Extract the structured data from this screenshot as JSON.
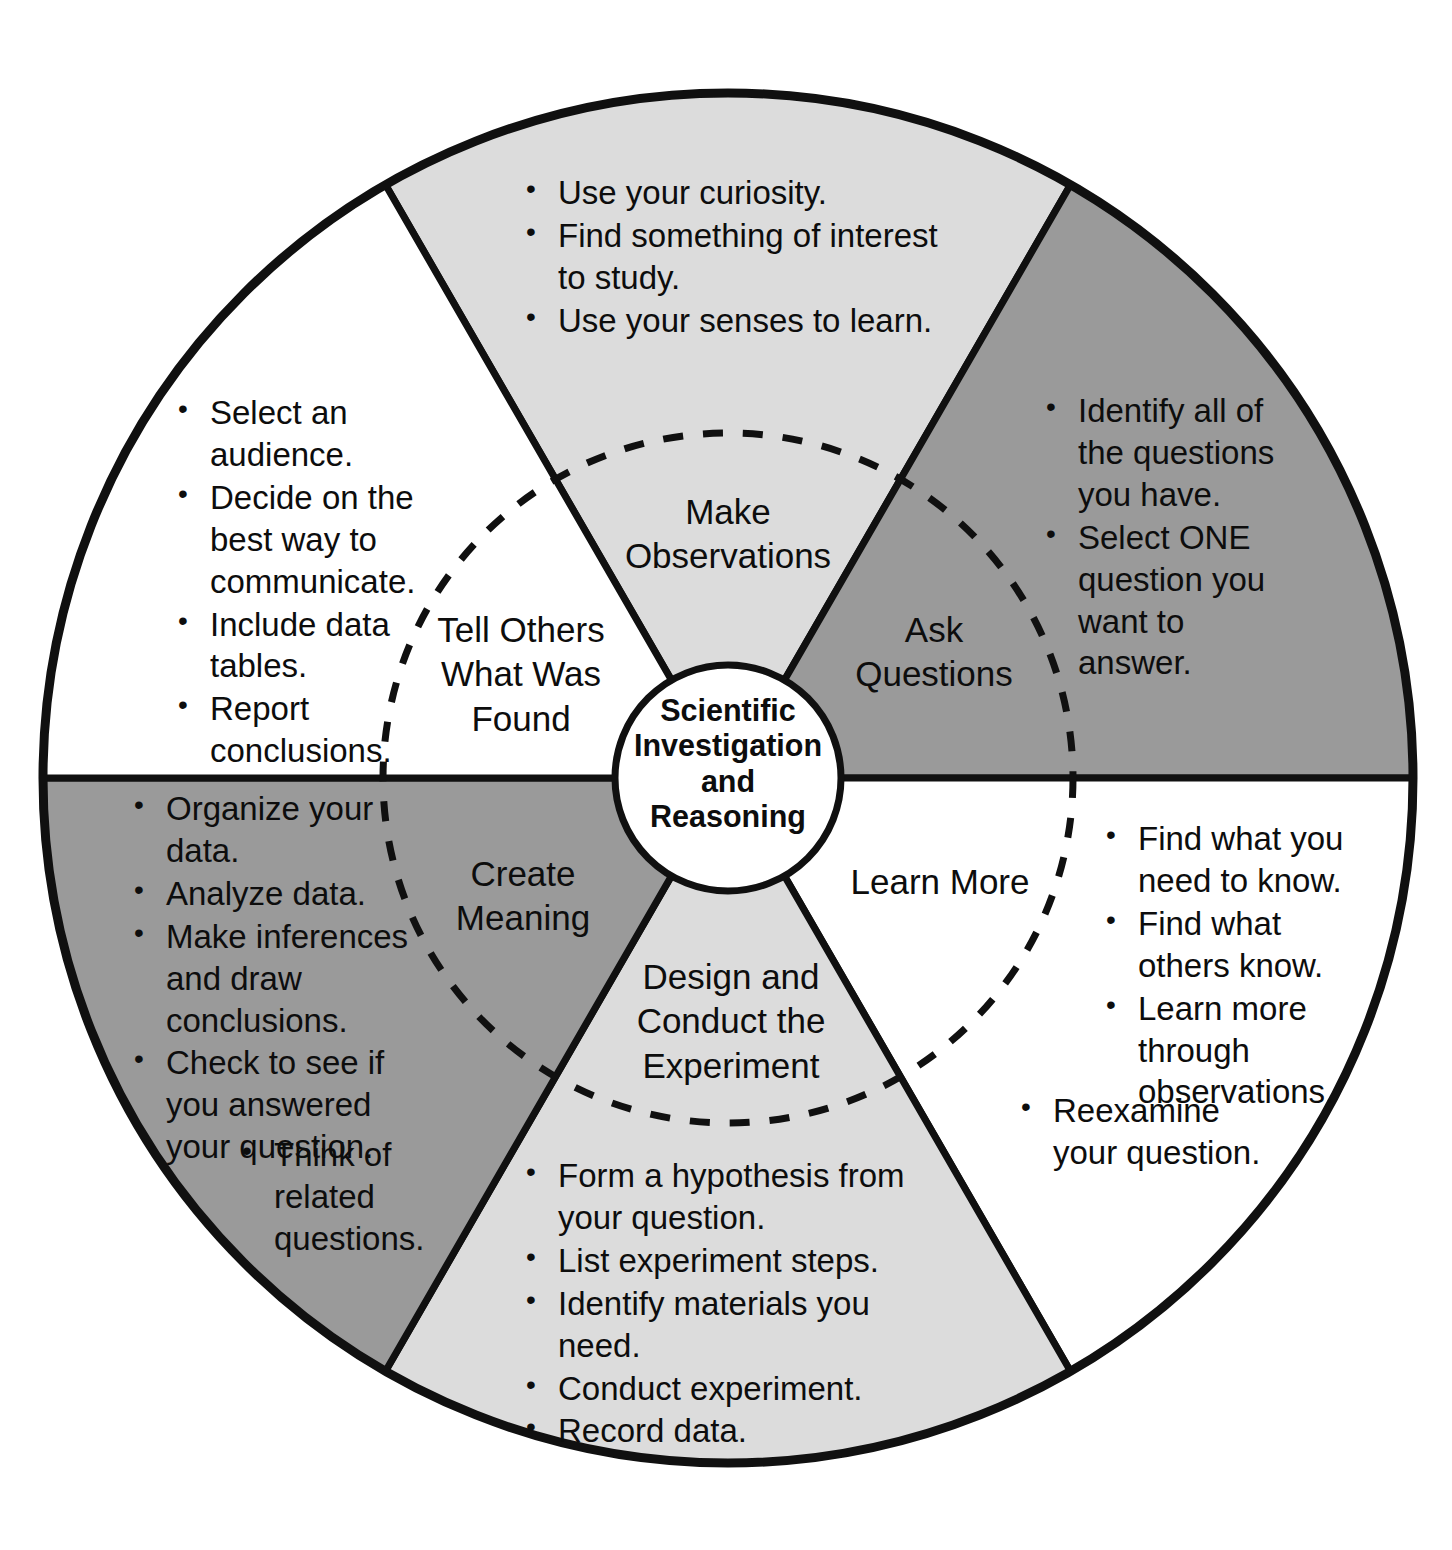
{
  "diagram": {
    "title": "Scientific Investigation and Reasoning",
    "type": "cycle-wheel",
    "hub_label": "Scientific\nInvestigation\nand\nReasoning",
    "colors": {
      "background": "#ffffff",
      "outline": "#101010",
      "light_gray": "#dcdcdc",
      "mid_gray": "#9a9a9a",
      "white_fill": "#ffffff"
    },
    "segments": [
      {
        "id": "make-observations",
        "label": "Make\nObservations",
        "fill": "#dcdcdc",
        "bullets": [
          "Use your curiosity.",
          "Find something of interest to study.",
          "Use your senses to learn."
        ]
      },
      {
        "id": "ask-questions",
        "label": "Ask\nQuestions",
        "fill": "#9a9a9a",
        "bullets": [
          "Identify all of the questions you have.",
          "Select ONE question you want to answer."
        ]
      },
      {
        "id": "learn-more",
        "label": "Learn More",
        "fill": "#ffffff",
        "bullets": [
          "Find what you need to know.",
          "Find what others know.",
          "Learn more through observations.",
          "Reexamine your question."
        ]
      },
      {
        "id": "design-and-conduct-the-experiment",
        "label": "Design and\nConduct the\nExperiment",
        "fill": "#dcdcdc",
        "bullets": [
          "Form a hypothesis from your question.",
          "List experiment steps.",
          "Identify materials you need.",
          "Conduct experiment.",
          "Record data."
        ]
      },
      {
        "id": "create-meaning",
        "label": "Create\nMeaning",
        "fill": "#9a9a9a",
        "bullets": [
          "Organize your data.",
          "Analyze data.",
          "Make inferences and draw conclusions.",
          "Check to see if you answered your question.",
          "Think of related questions."
        ]
      },
      {
        "id": "tell-others-what-was-found",
        "label": "Tell Others\nWhat Was\nFound",
        "fill": "#ffffff",
        "bullets": [
          "Select an audience.",
          "Decide on the best way to communicate.",
          "Include data tables.",
          "Report conclusions."
        ]
      }
    ]
  }
}
